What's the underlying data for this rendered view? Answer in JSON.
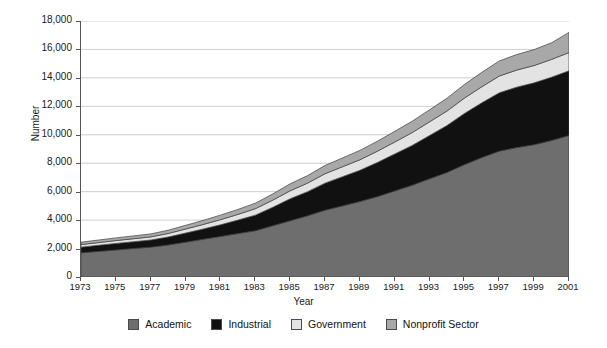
{
  "chart_data": {
    "type": "area",
    "stacked": true,
    "title": "",
    "xlabel": "Year",
    "ylabel": "Number",
    "ylim": [
      0,
      18000
    ],
    "ytick_step": 2000,
    "ytick_labels": [
      "0",
      "2,000",
      "4,000",
      "6,000",
      "8,000",
      "10,000",
      "12,000",
      "14,000",
      "16,000",
      "18,000"
    ],
    "ytick_values": [
      0,
      2000,
      4000,
      6000,
      8000,
      10000,
      12000,
      14000,
      16000,
      18000
    ],
    "xlim": [
      1973,
      2001
    ],
    "xtick_labels": [
      "1973",
      "1975",
      "1977",
      "1979",
      "1981",
      "1983",
      "1985",
      "1987",
      "1989",
      "1991",
      "1993",
      "1995",
      "1997",
      "1999",
      "2001"
    ],
    "xtick_values": [
      1973,
      1975,
      1977,
      1979,
      1981,
      1983,
      1985,
      1987,
      1989,
      1991,
      1993,
      1995,
      1997,
      1999,
      2001
    ],
    "grid": "horizontal",
    "legend_position": "bottom",
    "x": [
      1973,
      1974,
      1975,
      1976,
      1977,
      1978,
      1979,
      1980,
      1981,
      1982,
      1983,
      1984,
      1985,
      1986,
      1987,
      1988,
      1989,
      1990,
      1991,
      1992,
      1993,
      1994,
      1995,
      1996,
      1997,
      1998,
      1999,
      2000,
      2001
    ],
    "series": [
      {
        "name": "Academic",
        "color": "#6e6e6e",
        "values": [
          1700,
          1800,
          1900,
          2000,
          2100,
          2250,
          2450,
          2650,
          2850,
          3050,
          3250,
          3600,
          3950,
          4300,
          4700,
          5000,
          5300,
          5650,
          6050,
          6450,
          6900,
          7350,
          7900,
          8400,
          8850,
          9100,
          9300,
          9600,
          9950
        ]
      },
      {
        "name": "Industrial",
        "color": "#111111",
        "values": [
          400,
          430,
          460,
          480,
          500,
          560,
          640,
          720,
          820,
          950,
          1100,
          1300,
          1550,
          1700,
          1900,
          2050,
          2200,
          2400,
          2600,
          2800,
          3050,
          3300,
          3600,
          3850,
          4100,
          4250,
          4350,
          4450,
          4550
        ]
      },
      {
        "name": "Government",
        "color": "#e3e3e3",
        "values": [
          180,
          190,
          200,
          210,
          220,
          250,
          280,
          320,
          360,
          400,
          450,
          500,
          560,
          600,
          660,
          700,
          740,
          790,
          840,
          900,
          960,
          1020,
          1080,
          1130,
          1180,
          1200,
          1220,
          1250,
          1280
        ]
      },
      {
        "name": "Nonprofit Sector",
        "color": "#a8a8a8",
        "values": [
          170,
          180,
          190,
          200,
          210,
          230,
          260,
          290,
          320,
          350,
          390,
          440,
          490,
          530,
          580,
          620,
          660,
          700,
          750,
          800,
          850,
          900,
          960,
          1010,
          1060,
          1090,
          1120,
          1170,
          1420
        ]
      }
    ],
    "totals": [
      2450,
      2600,
      2750,
      2890,
      3030,
      3290,
      3630,
      3980,
      4350,
      4750,
      5190,
      5840,
      6550,
      7130,
      7840,
      8370,
      8900,
      9540,
      10240,
      10950,
      11760,
      12570,
      13540,
      14390,
      15190,
      15640,
      15990,
      16470,
      17200
    ]
  },
  "legend": {
    "items": [
      {
        "label": "Academic",
        "swatch": "legend-swatch-academic"
      },
      {
        "label": "Industrial",
        "swatch": "legend-swatch-industrial"
      },
      {
        "label": "Government",
        "swatch": "legend-swatch-government"
      },
      {
        "label": "Nonprofit Sector",
        "swatch": "legend-swatch-nonprofit"
      }
    ]
  }
}
